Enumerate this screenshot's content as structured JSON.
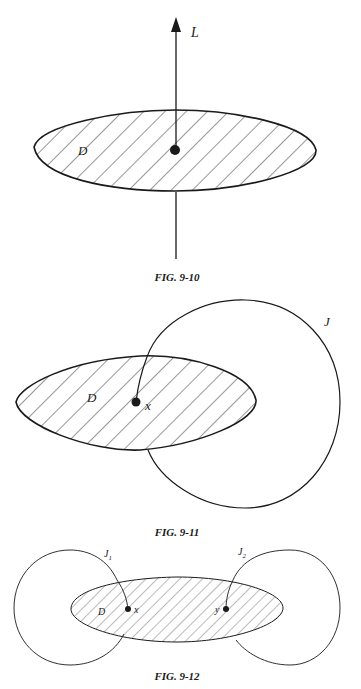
{
  "figures": [
    {
      "id": "fig-9-10",
      "caption": "FIG. 9-10",
      "labels": {
        "line": "L",
        "disk": "D"
      }
    },
    {
      "id": "fig-9-11",
      "caption": "FIG. 9-11",
      "labels": {
        "curve": "J",
        "disk": "D",
        "point": "x"
      }
    },
    {
      "id": "fig-9-12",
      "caption": "FIG. 9-12",
      "labels": {
        "curve1": "J",
        "curve1_sub": "1",
        "curve2": "J",
        "curve2_sub": "2",
        "disk": "D",
        "point1": "x",
        "point2": "y"
      }
    }
  ],
  "colors": {
    "ink": "#1a1a1a",
    "background": "#ffffff"
  }
}
